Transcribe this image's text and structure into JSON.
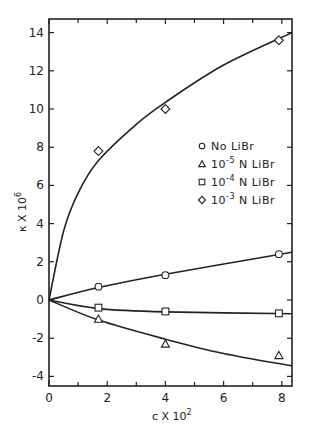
{
  "chart_data": {
    "type": "line",
    "title": "",
    "xlabel": "c X 10^2",
    "ylabel": "κ X 10^6",
    "xlim": [
      0,
      8.35
    ],
    "ylim": [
      -4.5,
      14.8
    ],
    "xticks": [
      0,
      2,
      4,
      6,
      8
    ],
    "yticks": [
      -4,
      -2,
      0,
      2,
      4,
      6,
      8,
      10,
      12,
      14
    ],
    "grid": false,
    "legend_position": "right-middle",
    "series": [
      {
        "name": "No LiBr",
        "marker": "circle",
        "points": [
          [
            1.7,
            0.7
          ],
          [
            4.0,
            1.3
          ],
          [
            7.9,
            2.4
          ]
        ],
        "curve": [
          [
            0,
            0
          ],
          [
            1.7,
            0.65
          ],
          [
            4.0,
            1.35
          ],
          [
            8.35,
            2.5
          ]
        ]
      },
      {
        "name": "10^-5 N LiBr",
        "marker": "triangle",
        "points": [
          [
            1.7,
            -1.0
          ],
          [
            4.0,
            -2.3
          ],
          [
            7.9,
            -2.9
          ]
        ],
        "curve": [
          [
            0,
            0
          ],
          [
            1.7,
            -1.05
          ],
          [
            4.0,
            -2.05
          ],
          [
            6.0,
            -2.8
          ],
          [
            8.35,
            -3.45
          ]
        ]
      },
      {
        "name": "10^-4 N LiBr",
        "marker": "square",
        "points": [
          [
            1.7,
            -0.4
          ],
          [
            4.0,
            -0.6
          ],
          [
            7.9,
            -0.7
          ]
        ],
        "curve": [
          [
            0,
            0
          ],
          [
            1.7,
            -0.45
          ],
          [
            4.0,
            -0.62
          ],
          [
            8.35,
            -0.72
          ]
        ]
      },
      {
        "name": "10^-3 N LiBr",
        "marker": "diamond",
        "points": [
          [
            1.7,
            7.8
          ],
          [
            4.0,
            10.0
          ],
          [
            7.9,
            13.6
          ]
        ],
        "curve": [
          [
            0,
            0
          ],
          [
            0.5,
            3.6
          ],
          [
            1.0,
            5.6
          ],
          [
            1.7,
            7.3
          ],
          [
            3.0,
            9.2
          ],
          [
            4.0,
            10.35
          ],
          [
            6.0,
            12.3
          ],
          [
            8.35,
            14.0
          ]
        ]
      }
    ]
  },
  "legend": {
    "items": [
      {
        "marker": "circle",
        "label": "No LiBr"
      },
      {
        "marker": "triangle",
        "base": "10",
        "exp": "-5",
        "suffix": "N LiBr"
      },
      {
        "marker": "square",
        "base": "10",
        "exp": "-4",
        "suffix": "N LiBr"
      },
      {
        "marker": "diamond",
        "base": "10",
        "exp": "-3",
        "suffix": "N LiBr"
      }
    ]
  },
  "axes": {
    "x_title_main": "c X 10",
    "x_title_exp": "2",
    "y_title_main": "κ X 10",
    "y_title_exp": "6"
  }
}
